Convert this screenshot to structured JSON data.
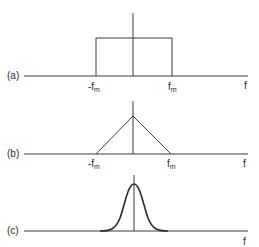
{
  "diagram": {
    "panels": [
      {
        "id": "a",
        "label": "(a)",
        "shape": "rectangle",
        "tick_left": "-f",
        "tick_left_sub": "m",
        "tick_right": "f",
        "tick_right_sub": "m",
        "axis_label": "f"
      },
      {
        "id": "b",
        "label": "(b)",
        "shape": "triangle",
        "tick_left": "-f",
        "tick_left_sub": "m",
        "tick_right": "f",
        "tick_right_sub": "m",
        "axis_label": "f"
      },
      {
        "id": "c",
        "label": "(c)",
        "shape": "gaussian",
        "axis_label": "f"
      }
    ],
    "colors": {
      "line": "#3a3a3a",
      "text": "#2a2a2a",
      "background": "#ffffff"
    }
  }
}
